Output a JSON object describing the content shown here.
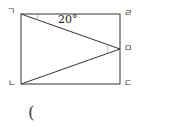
{
  "diagram": {
    "labels": {
      "top_left": "ㄱ",
      "top_right": "ㄹ",
      "mid_right": "ㅁ",
      "bottom_left": "ㄴ",
      "bottom_right": "ㄷ"
    },
    "angle_label": "20°",
    "answer_paren": "(",
    "line_color": "#333333"
  }
}
